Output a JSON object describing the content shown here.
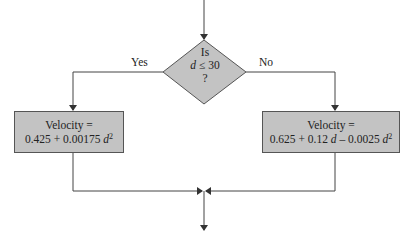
{
  "flowchart": {
    "decision": {
      "line1": "Is",
      "line2_var": "d",
      "line2_rest": " ≤ 30",
      "line3": "?"
    },
    "yes_label": "Yes",
    "no_label": "No",
    "yes_box": {
      "title": "Velocity =",
      "expr_a": "0.425 + 0.00175 ",
      "expr_var": "d",
      "expr_exp": "2"
    },
    "no_box": {
      "title": "Velocity =",
      "expr_a": "0.625 + 0.12 ",
      "expr_var1": "d",
      "expr_b": " – 0.0025 ",
      "expr_var2": "d",
      "expr_exp": "2"
    },
    "colors": {
      "shape_fill": "#c3c3c3",
      "stroke": "#555555"
    }
  }
}
